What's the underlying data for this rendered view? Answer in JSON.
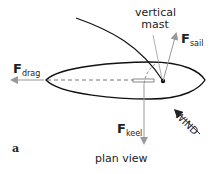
{
  "labels": {
    "mast_line1": "vertical",
    "mast_line2": "mast",
    "f_sail": "F",
    "f_sail_sub": "sail",
    "f_drag": "F",
    "f_drag_sub": "drag",
    "f_keel": "F",
    "f_keel_sub": "keel",
    "wind": "WIND",
    "panel": "a",
    "caption": "plan view"
  },
  "colors": {
    "hull": "#111111",
    "force_arrow": "#999999",
    "wind_arrow": "#222222",
    "text": "#222222"
  }
}
